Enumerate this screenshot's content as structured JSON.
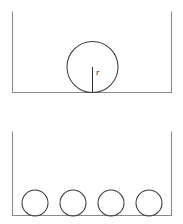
{
  "figure": {
    "background_color": "#ffffff",
    "wall_color": "#8a8a8a",
    "circle_color": "#3c3c3c",
    "label_color": "#2e2e2e",
    "panels": [
      {
        "id": "top-panel",
        "name": "single-large-circle-panel",
        "container": {
          "name": "open-top-container",
          "left_x": 12,
          "right_x": 172,
          "top_y": 12,
          "bottom_y": 93,
          "width": 160,
          "height": 81,
          "open_side": "top"
        },
        "circles": [
          {
            "name": "large-circle",
            "cx": 92.5,
            "cy": 67,
            "r": 25.5,
            "diameter": 51
          }
        ],
        "annotations": [
          {
            "name": "radius-segment",
            "type": "line",
            "x1": 92.5,
            "y1": 67,
            "x2": 92.5,
            "y2": 92.5
          },
          {
            "name": "radius-label",
            "type": "text",
            "text": "r",
            "x": 96,
            "y": 75
          }
        ]
      },
      {
        "id": "bottom-panel",
        "name": "four-small-circles-panel",
        "container": {
          "name": "open-top-container",
          "left_x": 12,
          "right_x": 172,
          "top_y": 132,
          "bottom_y": 216,
          "width": 160,
          "height": 84,
          "open_side": "top"
        },
        "circles": [
          {
            "name": "small-circle-1",
            "cx": 35,
            "cy": 203,
            "r": 13,
            "diameter": 26
          },
          {
            "name": "small-circle-2",
            "cx": 73,
            "cy": 203,
            "r": 13,
            "diameter": 26
          },
          {
            "name": "small-circle-3",
            "cx": 111,
            "cy": 203,
            "r": 13,
            "diameter": 26
          },
          {
            "name": "small-circle-4",
            "cx": 149,
            "cy": 203,
            "r": 13,
            "diameter": 26
          }
        ],
        "annotations": []
      }
    ]
  }
}
